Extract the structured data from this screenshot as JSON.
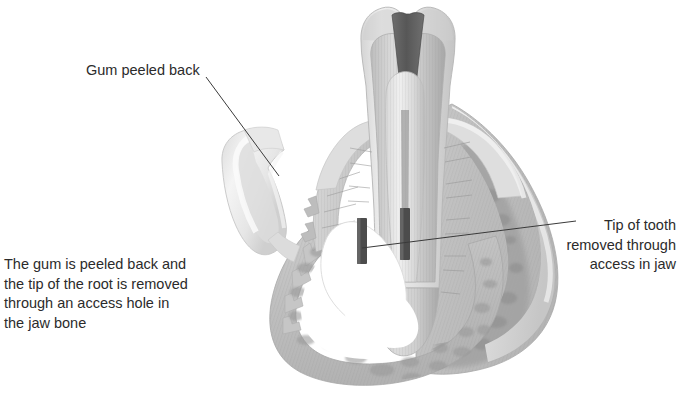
{
  "figure": {
    "kind": "dental-anatomy-cross-section",
    "title_alt": "Apicoectomy: gum peeled back and root tip removed through access hole in jaw bone",
    "background_color": "#ffffff",
    "ink_color": "#2b2b2b",
    "leader_line_color": "#3a3a3a",
    "palette": {
      "enamel_light": "#e9e9e9",
      "enamel_shadow": "#c8c8c8",
      "dentin_mid": "#b9b9b9",
      "dentin_dark": "#9e9e9e",
      "pulp_dark": "#5f5f5f",
      "root_tip_fragment": "#4f4f4f",
      "bone_base": "#c2c2c2",
      "bone_trabecula": "#9a9a9a",
      "gum_flap": "#ededed",
      "gum_flap_edge": "#cfcfcf",
      "access_hole": "#ffffff"
    }
  },
  "annotations": {
    "gum_peeled_back": {
      "label": "Gum peeled back",
      "leader": "line from label down-right into the reflected gum flap"
    },
    "tip_removed": {
      "label": "Tip of tooth\nremoved through\naccess in jaw",
      "leader": "line from label left into the severed root tip inside the jaw"
    }
  },
  "caption": {
    "text": "The gum is peeled back and\nthe tip of the root is removed\nthrough an access hole in\nthe jaw bone"
  }
}
